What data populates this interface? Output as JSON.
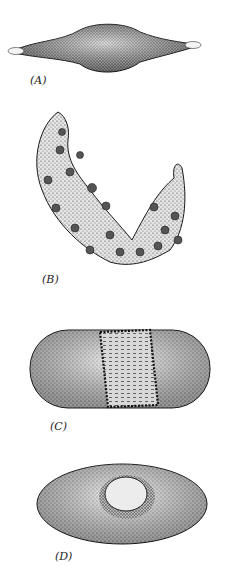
{
  "figures": [
    {
      "id": "A",
      "label": "(A)",
      "description": "spindle-shaped body with pale pointed tips, densely stippled"
    },
    {
      "id": "B",
      "label": "(B)",
      "description": "curved V-shaped two-lobed form with dark spots"
    },
    {
      "id": "C",
      "label": "(C)",
      "description": "capsule-shaped body with central dotted band"
    },
    {
      "id": "D",
      "label": "(D)",
      "description": "oval body with central circular pore"
    }
  ],
  "colors": {
    "ink": "#1a1a1a",
    "paper": "#ffffff",
    "shade": "#8a8a8a"
  }
}
